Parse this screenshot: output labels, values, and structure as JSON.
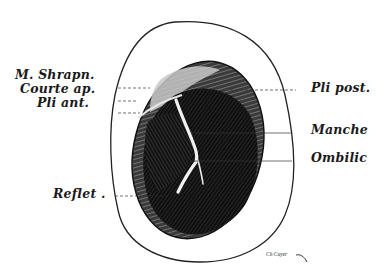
{
  "figure": {
    "labels_left": [
      {
        "id": "m-shrapn",
        "text": "M. Shrapn."
      },
      {
        "id": "courte-ap",
        "text": "Courte ap."
      },
      {
        "id": "pli-ant",
        "text": "Pli ant."
      },
      {
        "id": "reflet",
        "text": "Reflet ."
      }
    ],
    "labels_right": [
      {
        "id": "pli-post",
        "text": "Pli post."
      },
      {
        "id": "manche",
        "text": "Manche"
      },
      {
        "id": "ombilic",
        "text": "Ombilic"
      }
    ],
    "signature": "Ch Cuyer",
    "colors": {
      "ink": "#1a1a1a",
      "paper": "#ffffff"
    }
  }
}
